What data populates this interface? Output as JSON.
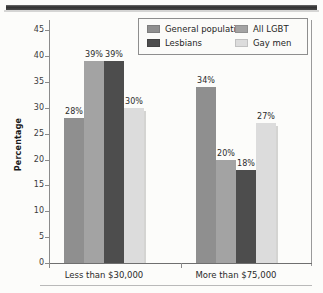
{
  "chart_data": {
    "type": "bar",
    "title": "",
    "xlabel": "",
    "ylabel": "Percentage",
    "ylim": [
      0,
      47
    ],
    "yticks": [
      0,
      5,
      10,
      15,
      20,
      25,
      30,
      35,
      40,
      45
    ],
    "grid": false,
    "legend_position": "top-right",
    "categories": [
      "Less than $30,000",
      "More than $75,000"
    ],
    "series": [
      {
        "name": "General population",
        "color": "#8f8f8f",
        "values": [
          28,
          34
        ],
        "labels": [
          "28%",
          "34%"
        ]
      },
      {
        "name": "All LGBT",
        "color": "#a3a3a3",
        "values": [
          39,
          20
        ],
        "labels": [
          "39%",
          "20%"
        ]
      },
      {
        "name": "Lesbians",
        "color": "#4d4d4d",
        "values": [
          39,
          18
        ],
        "labels": [
          "39%",
          "18%"
        ]
      },
      {
        "name": "Gay men",
        "color": "#dcdcdc",
        "values": [
          30,
          27
        ],
        "labels": [
          "30%",
          "27%"
        ]
      }
    ]
  },
  "axis": {
    "y_title": "Percentage",
    "y_tick_labels": [
      "45",
      "40",
      "35",
      "30",
      "25",
      "20",
      "15",
      "10",
      "5",
      "0"
    ],
    "x_tick_labels": [
      "Less than $30,000",
      "More than $75,000"
    ]
  },
  "legend": {
    "entries": [
      {
        "label": "General population",
        "swatch": "#8f8f8f"
      },
      {
        "label": "All LGBT",
        "swatch": "#a3a3a3"
      },
      {
        "label": "Lesbians",
        "swatch": "#4d4d4d"
      },
      {
        "label": "Gay men",
        "swatch": "#dcdcdc"
      }
    ]
  }
}
